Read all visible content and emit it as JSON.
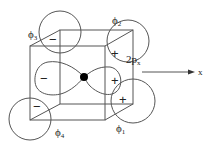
{
  "diagram": {
    "labels": {
      "phi1": "ϕ",
      "phi1_sub": "1",
      "phi2": "ϕ",
      "phi2_sub": "2",
      "phi3": "ϕ",
      "phi3_sub": "3",
      "phi4": "ϕ",
      "phi4_sub": "4",
      "orbital": "2p",
      "orbital_sub": "x",
      "axis": "x"
    },
    "signs": {
      "phi3": "−",
      "phi2": "+",
      "phi4": "−",
      "phi1": "+",
      "p_left_lobe": "−",
      "p_right_lobe": "+"
    },
    "colors": {
      "line": "#555555",
      "text": "#222222",
      "nucleus": "#000000",
      "background": "#ffffff"
    }
  }
}
